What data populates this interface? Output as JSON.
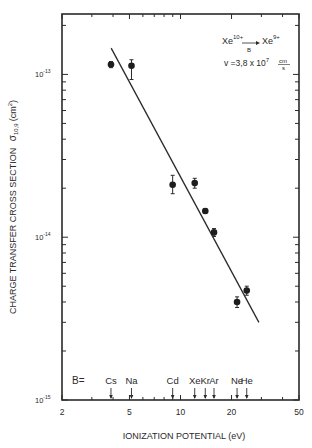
{
  "chart_data": {
    "type": "scatter",
    "title": "",
    "xlabel": "IONIZATION POTENTIAL (eV)",
    "ylabel": "CHARGE TRANSFER CROSS SECTION",
    "ylabel_symbol": "σ",
    "ylabel_subscript": "10,9",
    "ylabel_unit": "(cm",
    "ylabel_unit_sup": "2",
    "ylabel_unit_close": ")",
    "xscale": "log",
    "yscale": "log",
    "xlim": [
      2,
      50
    ],
    "ylim": [
      1e-15,
      2.35e-13
    ],
    "x_ticks": [
      {
        "value": 2,
        "label": "2"
      },
      {
        "value": 5,
        "label": "5"
      },
      {
        "value": 10,
        "label": "10"
      },
      {
        "value": 20,
        "label": "20"
      },
      {
        "value": 50,
        "label": "50"
      }
    ],
    "y_ticks": [
      {
        "value": 1e-13,
        "label": "10",
        "exp": "-13"
      },
      {
        "value": 1e-14,
        "label": "10",
        "exp": "-14"
      },
      {
        "value": 1e-15,
        "label": "10",
        "exp": "-15"
      }
    ],
    "grid": false,
    "series": [
      {
        "name": "measured",
        "points": [
          {
            "label": "Cs",
            "x": 3.89,
            "y": 1.15e-13,
            "err_lo": 5e-15,
            "err_hi": 5e-15
          },
          {
            "label": "Na",
            "x": 5.14,
            "y": 1.13e-13,
            "err_lo": 2e-14,
            "err_hi": 1e-14
          },
          {
            "label": "Cd",
            "x": 8.99,
            "y": 2.1e-14,
            "err_lo": 2.5e-15,
            "err_hi": 3e-15
          },
          {
            "label": "Xe",
            "x": 12.13,
            "y": 2.15e-14,
            "err_lo": 1.5e-15,
            "err_hi": 1.5e-15
          },
          {
            "label": "Kr",
            "x": 14.0,
            "y": 1.45e-14,
            "err_lo": 5e-16,
            "err_hi": 5e-16
          },
          {
            "label": "Ar",
            "x": 15.76,
            "y": 1.07e-14,
            "err_lo": 6e-16,
            "err_hi": 6e-16
          },
          {
            "label": "Ne",
            "x": 21.56,
            "y": 4e-15,
            "err_lo": 3e-16,
            "err_hi": 3e-16
          },
          {
            "label": "He",
            "x": 24.59,
            "y": 4.7e-15,
            "err_lo": 3e-16,
            "err_hi": 3e-16
          }
        ]
      },
      {
        "name": "fit-line",
        "type": "line",
        "x": [
          3.9,
          29.0
        ],
        "y": [
          1.45e-13,
          3e-15
        ]
      }
    ],
    "annotations": {
      "reaction": {
        "reactant": "Xe",
        "reactant_charge": "10+",
        "arrow_label": "B",
        "product": "Xe",
        "product_charge": "9+"
      },
      "velocity": {
        "prefix": "v =3,8 x 10",
        "exp": "7",
        "unit_num": "cm",
        "unit_den": "s"
      },
      "target_prefix": "B=",
      "targets": [
        {
          "label": "Cs",
          "x": 3.89
        },
        {
          "label": "Na",
          "x": 5.14
        },
        {
          "label": "Cd",
          "x": 8.99
        },
        {
          "label": "Xe",
          "x": 12.13
        },
        {
          "label": "Kr",
          "x": 14.0
        },
        {
          "label": "Ar",
          "x": 15.76
        },
        {
          "label": "Ne",
          "x": 21.56
        },
        {
          "label": "He",
          "x": 24.59
        }
      ]
    }
  }
}
